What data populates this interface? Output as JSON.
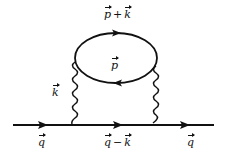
{
  "diagram": {
    "type": "feynman",
    "colors": {
      "line": "#111111",
      "background": "#ffffff"
    },
    "propagators": [
      {
        "id": "incoming",
        "kind": "fermion",
        "label": "q",
        "arrow": "right"
      },
      {
        "id": "internal",
        "kind": "fermion",
        "label_parts": [
          "q",
          "−",
          "k"
        ],
        "arrow": "right"
      },
      {
        "id": "outgoing",
        "kind": "fermion",
        "label": "q",
        "arrow": "right"
      },
      {
        "id": "loop-top",
        "kind": "fermion-loop",
        "label_parts": [
          "p",
          "+",
          "k"
        ],
        "arrow": "right"
      },
      {
        "id": "loop-bottom",
        "kind": "fermion-loop",
        "label": "p",
        "arrow": "left"
      },
      {
        "id": "boson-left",
        "kind": "wavy",
        "label": "k"
      },
      {
        "id": "boson-right",
        "kind": "wavy",
        "label": ""
      }
    ],
    "labels": {
      "q_in": "q",
      "q_minus_k": {
        "a": "q",
        "op": "−",
        "b": "k"
      },
      "q_out": "q",
      "p_plus_k": {
        "a": "p",
        "op": "+",
        "b": "k"
      },
      "p": "p",
      "k": "k"
    }
  }
}
